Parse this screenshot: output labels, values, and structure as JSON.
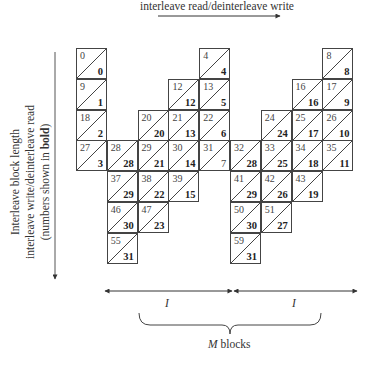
{
  "labels": {
    "top_axis": "interleave read/deinterleave write",
    "side_line1": "Interleave block length",
    "side_line2": "interleave write/deinterleave read",
    "side_line3_prefix": "(numbers shown in ",
    "side_line3_bold": "bold",
    "side_line3_suffix": ")",
    "span_left": "I",
    "span_right": "I",
    "brace_var": "M",
    "brace_suffix": " blocks"
  },
  "grid": {
    "origin_x": 76,
    "origin_y": 48,
    "cell_size": 31,
    "cells": [
      {
        "col": 0,
        "row": 0,
        "top": "0",
        "bottom": "0"
      },
      {
        "col": 4,
        "row": 0,
        "top": "4",
        "bottom": "4"
      },
      {
        "col": 8,
        "row": 0,
        "top": "8",
        "bottom": "8"
      },
      {
        "col": 0,
        "row": 1,
        "top": "9",
        "bottom": "1"
      },
      {
        "col": 3,
        "row": 1,
        "top": "12",
        "bottom": "12"
      },
      {
        "col": 4,
        "row": 1,
        "top": "13",
        "bottom": "5"
      },
      {
        "col": 7,
        "row": 1,
        "top": "16",
        "bottom": "16"
      },
      {
        "col": 8,
        "row": 1,
        "top": "17",
        "bottom": "9"
      },
      {
        "col": 0,
        "row": 2,
        "top": "18",
        "bottom": "2"
      },
      {
        "col": 2,
        "row": 2,
        "top": "20",
        "bottom": "20"
      },
      {
        "col": 3,
        "row": 2,
        "top": "21",
        "bottom": "13"
      },
      {
        "col": 4,
        "row": 2,
        "top": "22",
        "bottom": "6"
      },
      {
        "col": 6,
        "row": 2,
        "top": "24",
        "bottom": "24"
      },
      {
        "col": 7,
        "row": 2,
        "top": "25",
        "bottom": "17"
      },
      {
        "col": 8,
        "row": 2,
        "top": "26",
        "bottom": "10"
      },
      {
        "col": 0,
        "row": 3,
        "top": "27",
        "bottom": "3"
      },
      {
        "col": 1,
        "row": 3,
        "top": "28",
        "bottom": "28"
      },
      {
        "col": 2,
        "row": 3,
        "top": "29",
        "bottom": "21"
      },
      {
        "col": 3,
        "row": 3,
        "top": "30",
        "bottom": "14"
      },
      {
        "col": 4,
        "row": 3,
        "top": "31",
        "bottom": "7",
        "plain": true
      },
      {
        "col": 5,
        "row": 3,
        "top": "32",
        "bottom": "28"
      },
      {
        "col": 6,
        "row": 3,
        "top": "33",
        "bottom": "25"
      },
      {
        "col": 7,
        "row": 3,
        "top": "34",
        "bottom": "18"
      },
      {
        "col": 8,
        "row": 3,
        "top": "35",
        "bottom": "11"
      },
      {
        "col": 1,
        "row": 4,
        "top": "37",
        "bottom": "29"
      },
      {
        "col": 2,
        "row": 4,
        "top": "38",
        "bottom": "22"
      },
      {
        "col": 3,
        "row": 4,
        "top": "39",
        "bottom": "15"
      },
      {
        "col": 5,
        "row": 4,
        "top": "41",
        "bottom": "29"
      },
      {
        "col": 6,
        "row": 4,
        "top": "42",
        "bottom": "26"
      },
      {
        "col": 7,
        "row": 4,
        "top": "43",
        "bottom": "19"
      },
      {
        "col": 1,
        "row": 5,
        "top": "46",
        "bottom": "30"
      },
      {
        "col": 2,
        "row": 5,
        "top": "47",
        "bottom": "23"
      },
      {
        "col": 5,
        "row": 5,
        "top": "50",
        "bottom": "30"
      },
      {
        "col": 6,
        "row": 5,
        "top": "51",
        "bottom": "27"
      },
      {
        "col": 1,
        "row": 6,
        "top": "55",
        "bottom": "31"
      },
      {
        "col": 5,
        "row": 6,
        "top": "59",
        "bottom": "31"
      }
    ]
  },
  "colors": {
    "line": "#444444",
    "text": "#333333",
    "background": "#ffffff"
  }
}
